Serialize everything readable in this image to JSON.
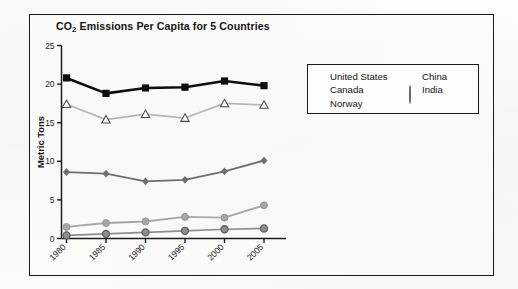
{
  "figure": {
    "title_main": "CO",
    "title_sub": "2",
    "title_rest": " Emissions Per Capita for 5 Countries"
  },
  "legend": {
    "left_entries": [
      {
        "label": "United States",
        "marker": "filled-square-marker",
        "color": "#0d0d0d"
      },
      {
        "label": "Canada",
        "marker": "open-triangle-marker",
        "color": "#b6b6b6"
      },
      {
        "label": "Norway",
        "marker": "filled-diamond-marker",
        "color": "#6e6e6e"
      }
    ],
    "right_entries": [
      {
        "label": "China",
        "marker": "light-circle-marker",
        "color": "#a8a8a8"
      },
      {
        "label": "India",
        "marker": "dark-circle-marker",
        "color": "#8e8e8e"
      }
    ]
  },
  "chart_data": {
    "type": "line",
    "title": "CO2 Emissions Per Capita for 5 Countries",
    "xlabel": "",
    "ylabel": "Metric Tons",
    "categories": [
      "1980",
      "1985",
      "1990",
      "1995",
      "2000",
      "2005"
    ],
    "x_tick_labels": [
      "1980",
      "1985",
      "1990",
      "1995",
      "2000",
      "2005"
    ],
    "x_tick_rotation_deg": 45,
    "y_tick_labels": [
      "0",
      "5",
      "10",
      "15",
      "20",
      "25"
    ],
    "y_ticks": [
      0,
      5,
      10,
      15,
      20,
      25
    ],
    "ylim": [
      0,
      25
    ],
    "grid": false,
    "legend_position": "upper right outside",
    "series": [
      {
        "name": "United States",
        "marker": "filled-square",
        "color": "#0d0d0d",
        "values": [
          20.8,
          18.8,
          19.5,
          19.6,
          20.4,
          19.8
        ]
      },
      {
        "name": "Canada",
        "marker": "open-triangle",
        "color": "#b6b6b6",
        "values": [
          17.4,
          15.4,
          16.1,
          15.6,
          17.5,
          17.3
        ]
      },
      {
        "name": "Norway",
        "marker": "filled-diamond",
        "color": "#6e6e6e",
        "values": [
          8.6,
          8.4,
          7.4,
          7.6,
          8.7,
          10.1
        ]
      },
      {
        "name": "China",
        "marker": "light-circle",
        "color": "#a8a8a8",
        "values": [
          1.5,
          2.0,
          2.2,
          2.8,
          2.7,
          4.3
        ]
      },
      {
        "name": "India",
        "marker": "dark-circle",
        "color": "#8e8e8e",
        "values": [
          0.4,
          0.6,
          0.8,
          1.0,
          1.2,
          1.3
        ]
      }
    ]
  }
}
